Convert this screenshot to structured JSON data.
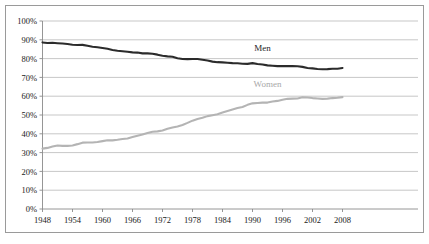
{
  "chart_data": {
    "type": "line",
    "title": "",
    "subtitle": "",
    "xlabel": "",
    "ylabel": "",
    "xlim": [
      1948,
      2009
    ],
    "ylim": [
      0,
      100
    ],
    "grid": true,
    "legend_position": "inline-labels",
    "y_tick_labels": [
      "0%",
      "10%",
      "20%",
      "30%",
      "40%",
      "50%",
      "60%",
      "70%",
      "80%",
      "90%",
      "100%"
    ],
    "y_tick_values": [
      0,
      10,
      20,
      30,
      40,
      50,
      60,
      70,
      80,
      90,
      100
    ],
    "x_tick_labels": [
      "1948",
      "1954",
      "1960",
      "1966",
      "1972",
      "1978",
      "1984",
      "1990",
      "1996",
      "2002",
      "2008"
    ],
    "x_tick_values": [
      1948,
      1954,
      1960,
      1966,
      1972,
      1978,
      1984,
      1990,
      1996,
      2002,
      2008
    ],
    "x": [
      1948,
      1949,
      1950,
      1951,
      1952,
      1953,
      1954,
      1955,
      1956,
      1957,
      1958,
      1959,
      1960,
      1961,
      1962,
      1963,
      1964,
      1965,
      1966,
      1967,
      1968,
      1969,
      1970,
      1971,
      1972,
      1973,
      1974,
      1975,
      1976,
      1977,
      1978,
      1979,
      1980,
      1981,
      1982,
      1983,
      1984,
      1985,
      1986,
      1987,
      1988,
      1989,
      1990,
      1991,
      1992,
      1993,
      1994,
      1995,
      1996,
      1997,
      1998,
      1999,
      2000,
      2001,
      2002,
      2003,
      2004,
      2005,
      2006,
      2007,
      2008
    ],
    "series": [
      {
        "name": "Men",
        "color": "#2b2b2b",
        "label_x": 1992,
        "label_y": 84,
        "values": [
          88.6,
          88.3,
          88.4,
          88.2,
          88.0,
          87.8,
          87.4,
          87.2,
          87.3,
          86.8,
          86.3,
          86.0,
          85.6,
          85.2,
          84.6,
          84.2,
          83.9,
          83.6,
          83.3,
          83.2,
          82.8,
          82.8,
          82.6,
          82.1,
          81.5,
          81.2,
          81.0,
          80.2,
          79.8,
          79.7,
          79.8,
          79.8,
          79.4,
          79.0,
          78.4,
          78.1,
          78.0,
          77.8,
          77.6,
          77.5,
          77.3,
          77.2,
          77.6,
          77.1,
          76.9,
          76.4,
          76.2,
          76.0,
          76.0,
          76.1,
          76.0,
          75.9,
          75.6,
          75.0,
          74.8,
          74.5,
          74.3,
          74.4,
          74.6,
          74.6,
          75.0
        ]
      },
      {
        "name": "Women",
        "color": "#b4b4b4",
        "label_x": 1993,
        "label_y": 65,
        "values": [
          32.1,
          32.5,
          33.2,
          33.8,
          33.6,
          33.6,
          33.8,
          34.5,
          35.3,
          35.4,
          35.4,
          35.6,
          36.1,
          36.6,
          36.5,
          36.8,
          37.2,
          37.5,
          38.3,
          39.0,
          39.6,
          40.4,
          41.1,
          41.3,
          41.8,
          42.7,
          43.4,
          43.9,
          44.7,
          45.8,
          47.0,
          47.9,
          48.5,
          49.4,
          49.9,
          50.4,
          51.3,
          52.1,
          52.9,
          53.7,
          54.3,
          55.4,
          56.2,
          56.4,
          56.6,
          56.6,
          57.2,
          57.5,
          58.1,
          58.6,
          58.7,
          58.8,
          59.4,
          59.3,
          59.0,
          58.8,
          58.6,
          58.7,
          59.0,
          59.2,
          59.5
        ]
      }
    ]
  },
  "axis": {
    "y_axis_name": "percent-axis",
    "x_axis_name": "year-axis"
  }
}
